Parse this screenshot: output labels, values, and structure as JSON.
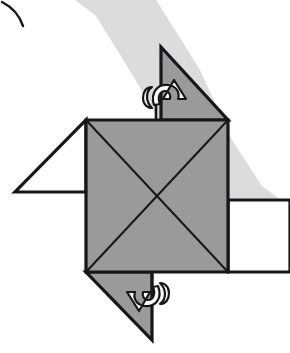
{
  "figure": {
    "background_color": "#ffffff",
    "line_color": "#17171a",
    "paper_fill": "#9a9a9a",
    "paper_fill_light": "#dcdcdc",
    "flap_white_fill": "#ffffff",
    "arrow_fill": "#ffffff",
    "band_color": "#dcdcdc",
    "stroke_width_outer": 3.2,
    "stroke_width_crease": 2.0
  },
  "shapes": {
    "background_band": {
      "name": "shadow-band",
      "color": "#dcdcdc",
      "path": "M 62 -10 L 150 -10 L 200 70 L 232 140 L 262 186 L 292 208 L 292 268 L 250 250 L 212 210 L 176 150 L 132 74 L 96 16 Z"
    },
    "corner_arc": {
      "name": "corner-arc-fragment",
      "color": "#17171a",
      "path": "M 2 2 C 10 6 19 14 23 26"
    },
    "center_square": {
      "name": "center-square",
      "fill": "#9a9a9a",
      "corners": [
        [
          86,
          120
        ],
        [
          228,
          120
        ],
        [
          228,
          272
        ],
        [
          86,
          272
        ]
      ],
      "diagonals": [
        [
          [
            86,
            120
          ],
          [
            228,
            272
          ]
        ],
        [
          [
            228,
            120
          ],
          [
            86,
            272
          ]
        ]
      ]
    },
    "flap_top": {
      "name": "flap-top-right",
      "fill": "#9a9a9a",
      "points": [
        [
          161,
          47
        ],
        [
          228,
          120
        ],
        [
          161,
          120
        ]
      ],
      "notch": [
        [
          156,
          104
        ],
        [
          156,
          120
        ]
      ]
    },
    "flap_bottom": {
      "name": "flap-bottom-left",
      "fill": "#9a9a9a",
      "points": [
        [
          86,
          272
        ],
        [
          152,
          272
        ],
        [
          152,
          340
        ]
      ],
      "notch": [
        [
          152,
          272
        ],
        [
          152,
          292
        ]
      ]
    },
    "flap_left": {
      "name": "flap-left",
      "fill": "#ffffff",
      "points": [
        [
          86,
          120
        ],
        [
          86,
          192
        ],
        [
          15,
          192
        ]
      ]
    },
    "flap_right": {
      "name": "flap-right",
      "fill": "#ffffff",
      "points": [
        [
          228,
          200
        ],
        [
          290,
          200
        ],
        [
          290,
          272
        ],
        [
          228,
          272
        ]
      ]
    },
    "arrow_top": {
      "name": "fold-arrow-top",
      "fill": "#ffffff",
      "direction": "up-right",
      "body_path": "M 154 105 C 150 92 158 84 168 85 C 177 86 180 93 178 99 L 186 99 L 174 80 L 163 99 L 170 99 C 171 95 169 91 165 91 C 160 91 157 97 160 104 Z",
      "curl_path": "M 152 87 C 146 87 143 92 143 98 C 143 104 147 108 152 108 C 148 104 147 100 147 97 C 147 93 149 89 152 87 Z"
    },
    "arrow_bottom": {
      "name": "fold-arrow-bottom",
      "fill": "#ffffff",
      "direction": "down-left",
      "body_path": "M 158 286 C 163 299 155 307 145 306 C 136 305 133 298 135 292 L 127 292 L 139 311 L 150 292 L 143 292 C 142 296 144 300 148 300 C 153 300 156 294 153 287 Z",
      "curl_path": "M 160 304 C 166 304 169 299 169 293 C 169 287 165 283 160 283 C 164 287 165 291 165 294 C 165 298 163 302 160 304 Z"
    }
  }
}
